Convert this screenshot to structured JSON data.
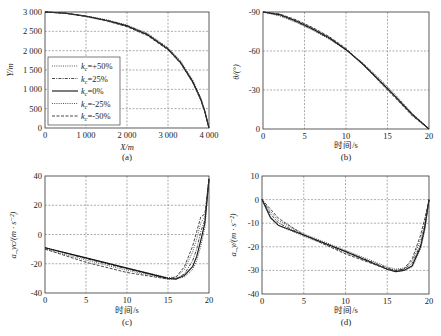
{
  "chart_data": [
    {
      "id": "a",
      "type": "line",
      "caption": "(a)",
      "xlabel": "X/m",
      "ylabel": "Y/m",
      "xlim": [
        0,
        4000
      ],
      "ylim": [
        0,
        3000
      ],
      "xticks": [
        "0",
        "1 000",
        "2 000",
        "3 000",
        "4 000"
      ],
      "yticks": [
        "0",
        "500",
        "1 000",
        "1 500",
        "2 000",
        "2 500",
        "3 000"
      ],
      "grid": true,
      "legend_position": "lower left",
      "legend": [
        "k_c=+50%",
        "k_c=25%",
        "k_c=0%",
        "k_c=-25%",
        "k_c=-50%"
      ],
      "x": [
        0,
        500,
        1000,
        1500,
        2000,
        2500,
        3000,
        3300,
        3600,
        3800,
        3900,
        4000
      ],
      "series": [
        {
          "name": "k_c=+50%",
          "style": "dotted",
          "values": [
            3000,
            2975,
            2900,
            2800,
            2660,
            2450,
            2080,
            1750,
            1250,
            780,
            450,
            0
          ]
        },
        {
          "name": "k_c=25%",
          "style": "dashdot",
          "values": [
            3000,
            2972,
            2895,
            2790,
            2650,
            2430,
            2060,
            1720,
            1220,
            760,
            430,
            0
          ]
        },
        {
          "name": "k_c=0%",
          "style": "solid",
          "values": [
            3000,
            2970,
            2890,
            2780,
            2640,
            2410,
            2040,
            1700,
            1200,
            740,
            420,
            0
          ]
        },
        {
          "name": "k_c=-25%",
          "style": "dotted",
          "values": [
            3000,
            2968,
            2885,
            2775,
            2630,
            2400,
            2030,
            1690,
            1190,
            730,
            410,
            0
          ]
        },
        {
          "name": "k_c=-50%",
          "style": "dashed",
          "values": [
            3000,
            2965,
            2880,
            2770,
            2620,
            2390,
            2020,
            1680,
            1180,
            720,
            400,
            0
          ]
        }
      ]
    },
    {
      "id": "b",
      "type": "line",
      "caption": "(b)",
      "xlabel": "时间/s",
      "ylabel": "θ/(°)",
      "xlim": [
        0,
        20
      ],
      "ylim": [
        -90,
        0
      ],
      "xticks": [
        "0",
        "5",
        "10",
        "15",
        "20"
      ],
      "yticks": [
        "0",
        "-30",
        "-60",
        "-90"
      ],
      "grid": true,
      "x": [
        0,
        2,
        4,
        6,
        8,
        10,
        12,
        14,
        16,
        18,
        20
      ],
      "series": [
        {
          "name": "k_c=+50%",
          "style": "dotted",
          "values": [
            0,
            -3,
            -8,
            -14,
            -21,
            -29,
            -39,
            -51,
            -64,
            -78,
            -90
          ]
        },
        {
          "name": "k_c=25%",
          "style": "dashdot",
          "values": [
            0,
            -2.5,
            -7.5,
            -13.5,
            -20.5,
            -29,
            -39.5,
            -52,
            -65,
            -78.5,
            -90
          ]
        },
        {
          "name": "k_c=0%",
          "style": "solid",
          "values": [
            0,
            -2,
            -7,
            -13,
            -20,
            -29,
            -40,
            -52.5,
            -65.5,
            -79,
            -90
          ]
        },
        {
          "name": "k_c=-25%",
          "style": "dotted",
          "values": [
            0,
            -1.8,
            -6.5,
            -12.5,
            -19.5,
            -28.5,
            -40,
            -53,
            -66,
            -79.5,
            -90
          ]
        },
        {
          "name": "k_c=-50%",
          "style": "dashed",
          "values": [
            0,
            -1.5,
            -6,
            -12,
            -19,
            -28,
            -40,
            -53.5,
            -66.5,
            -80,
            -90
          ]
        }
      ]
    },
    {
      "id": "c",
      "type": "line",
      "caption": "(c)",
      "xlabel": "时间/s",
      "ylabel": "a_yc/(m·s^-2)",
      "xlim": [
        0,
        20
      ],
      "ylim": [
        -40,
        40
      ],
      "xticks": [
        "0",
        "5",
        "10",
        "15",
        "20"
      ],
      "yticks": [
        "-40",
        "-20",
        "0",
        "20",
        "40"
      ],
      "grid": true,
      "x": [
        0,
        5,
        10,
        15,
        16,
        17,
        18,
        18.5,
        19,
        19.5,
        20
      ],
      "series": [
        {
          "name": "k_c=+50%",
          "style": "dotted",
          "values": [
            -9,
            -16,
            -23,
            -29.5,
            -29,
            -24,
            -12,
            -3,
            8,
            12,
            38
          ]
        },
        {
          "name": "k_c=25%",
          "style": "dashdot",
          "values": [
            -9,
            -16.5,
            -23.5,
            -30,
            -30,
            -27,
            -18,
            -10,
            2,
            10,
            38
          ]
        },
        {
          "name": "k_c=0%",
          "style": "solid",
          "values": [
            -9,
            -16,
            -23,
            -30,
            -30.5,
            -28,
            -22,
            -15,
            -4,
            8,
            38
          ]
        },
        {
          "name": "k_c=-25%",
          "style": "dotted",
          "values": [
            -10,
            -17.5,
            -24.5,
            -30.5,
            -30.5,
            -29,
            -24,
            -18,
            -8,
            5,
            38
          ]
        },
        {
          "name": "k_c=-50%",
          "style": "dashed",
          "values": [
            -10,
            -19,
            -26,
            -30.5,
            -29,
            -22,
            -8,
            2,
            12,
            14,
            38
          ]
        }
      ]
    },
    {
      "id": "d",
      "type": "line",
      "caption": "(d)",
      "xlabel": "时间/s",
      "ylabel": "a_y/(m·s^-2)",
      "xlim": [
        0,
        20
      ],
      "ylim": [
        -40,
        10
      ],
      "xticks": [
        "0",
        "5",
        "10",
        "15",
        "20"
      ],
      "yticks": [
        "-40",
        "-30",
        "-20",
        "-10",
        "0",
        "10"
      ],
      "grid": true,
      "x": [
        0,
        1,
        2,
        5,
        10,
        15,
        16,
        17,
        18,
        19,
        19.5,
        20
      ],
      "series": [
        {
          "name": "k_c=+50%",
          "style": "dotted",
          "values": [
            0,
            -5,
            -9,
            -14.5,
            -21.5,
            -28.5,
            -29.5,
            -29,
            -26,
            -17,
            -10,
            0
          ]
        },
        {
          "name": "k_c=25%",
          "style": "dashdot",
          "values": [
            0,
            -6,
            -10,
            -15,
            -22,
            -29,
            -30,
            -29.5,
            -27,
            -19,
            -11,
            0
          ]
        },
        {
          "name": "k_c=0%",
          "style": "solid",
          "values": [
            0,
            -7.5,
            -11,
            -15,
            -22,
            -29.5,
            -30.5,
            -30,
            -28,
            -20,
            -12,
            0
          ]
        },
        {
          "name": "k_c=-25%",
          "style": "dotted",
          "values": [
            0,
            -8,
            -11,
            -15.5,
            -22.5,
            -29.5,
            -30.5,
            -30,
            -28.5,
            -21,
            -13,
            0
          ]
        },
        {
          "name": "k_c=-50%",
          "style": "dashed",
          "values": [
            0,
            -4,
            -8,
            -15,
            -23,
            -29.5,
            -30,
            -29.5,
            -25,
            -15,
            -8,
            0
          ]
        }
      ]
    }
  ],
  "legend_labels": {
    "l0": {
      "k": "k",
      "sub": "c",
      "rest": "=+50%"
    },
    "l1": {
      "k": "k",
      "sub": "c",
      "rest": "=25%"
    },
    "l2": {
      "k": "k",
      "sub": "c",
      "rest": "=0%"
    },
    "l3": {
      "k": "k",
      "sub": "c",
      "rest": "=-25%"
    },
    "l4": {
      "k": "k",
      "sub": "c",
      "rest": "=-50%"
    }
  },
  "text": {
    "a": {
      "caption": "(a)",
      "xlabel": "X/m",
      "ylabel": "Y/m"
    },
    "b": {
      "caption": "(b)",
      "xlabel": "时间/s",
      "ylabel": "θ/(°)"
    },
    "c": {
      "caption": "(c)",
      "xlabel": "时间/s",
      "ylabel": "a_yc/(m · s⁻²)"
    },
    "d": {
      "caption": "(d)",
      "xlabel": "时间/s",
      "ylabel": "a_y/(m · s⁻²)"
    }
  }
}
